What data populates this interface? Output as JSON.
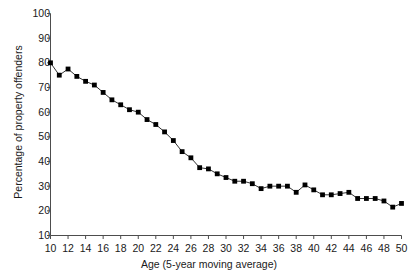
{
  "chart_data": {
    "type": "line",
    "title": "",
    "xlabel": "Age (5-year moving average)",
    "ylabel": "Percentage of property offenders",
    "xlim": [
      10,
      50
    ],
    "ylim": [
      10,
      100
    ],
    "xtick_step": 2,
    "ytick_step": 10,
    "grid": false,
    "legend": null,
    "marker": "square",
    "marker_color": "#000000",
    "line_color": "#333333",
    "x": [
      10,
      11,
      12,
      13,
      14,
      15,
      16,
      17,
      18,
      19,
      20,
      21,
      22,
      23,
      24,
      25,
      26,
      27,
      28,
      29,
      30,
      31,
      32,
      33,
      34,
      35,
      36,
      37,
      38,
      39,
      40,
      41,
      42,
      43,
      44,
      45,
      46,
      47,
      48,
      49,
      50
    ],
    "values": [
      80,
      75,
      77.5,
      74.5,
      72.5,
      71,
      68,
      65,
      63,
      61,
      60,
      57,
      55,
      52,
      48.5,
      44,
      41.5,
      37.5,
      37,
      35,
      33.5,
      32,
      32,
      31,
      29,
      30,
      30,
      30,
      27.5,
      30.5,
      28.5,
      26.5,
      26.5,
      27,
      27.5,
      25,
      25,
      25,
      24,
      21.5,
      23
    ],
    "xticks": [
      10,
      12,
      14,
      16,
      18,
      20,
      22,
      24,
      26,
      28,
      30,
      32,
      34,
      36,
      38,
      40,
      42,
      44,
      46,
      48,
      50
    ],
    "yticks": [
      10,
      20,
      30,
      40,
      50,
      60,
      70,
      80,
      90,
      100
    ],
    "ytick_labels": [
      "10",
      "20",
      "30",
      "40",
      "50",
      "60",
      "70",
      "80",
      "90",
      "100"
    ],
    "xtick_labels": [
      "10",
      "12",
      "14",
      "16",
      "18",
      "20",
      "22",
      "24",
      "26",
      "28",
      "30",
      "32",
      "34",
      "36",
      "38",
      "40",
      "42",
      "44",
      "46",
      "48",
      "50"
    ]
  }
}
